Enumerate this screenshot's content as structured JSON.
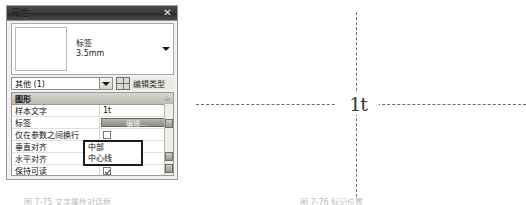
{
  "window": {
    "title": "属性",
    "close_label": "✕"
  },
  "preview": {
    "family": "标签",
    "size": "3.5mm",
    "caret_icon": "chevron-down-icon"
  },
  "type_row": {
    "selected": "其他 (1)",
    "edit_type_label": "编辑类型",
    "grid_icon": "grid-icon",
    "combo_caret_icon": "chevron-down-icon"
  },
  "group": {
    "header": "图形",
    "collapse_glyph": "☆"
  },
  "rows": [
    {
      "name": "样本文字",
      "value": "1t",
      "kind": "text"
    },
    {
      "name": "标签",
      "value": "编辑...",
      "kind": "button"
    },
    {
      "name": "仅在参数之间换行",
      "value": "",
      "kind": "checkbox",
      "checked": false
    },
    {
      "name": "垂直对齐",
      "value": "中部",
      "kind": "text"
    },
    {
      "name": "水平对齐",
      "value": "中心线",
      "kind": "text"
    },
    {
      "name": "保持可读",
      "value": "",
      "kind": "checkbox",
      "checked": true
    },
    {
      "name": "可见",
      "value": "",
      "kind": "checkbox",
      "checked": true
    }
  ],
  "dropdown": {
    "options": [
      "中部",
      "中心线"
    ]
  },
  "diagram": {
    "center_text": "1t",
    "h_line": "horizontal-dashed-axis",
    "v_line": "vertical-dashed-axis"
  },
  "captions": {
    "left": "图 7-75 文字属性对话框",
    "right": "图 7-76 标记位置"
  }
}
